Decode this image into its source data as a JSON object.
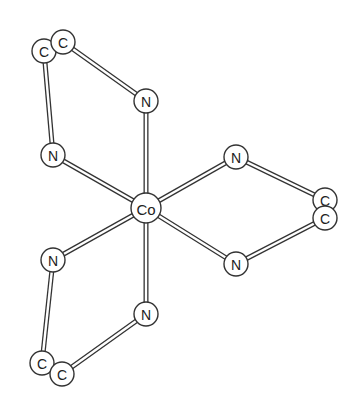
{
  "diagram": {
    "colors": {
      "stroke": "#333333",
      "bond_fill": "#ffffff",
      "atom_fill": "#ffffff",
      "background": "#ffffff"
    },
    "atoms": [
      {
        "id": "co",
        "label": "Co",
        "x": 146,
        "y": 208,
        "r": 15
      },
      {
        "id": "n1",
        "label": "N",
        "x": 146,
        "y": 101,
        "r": 12
      },
      {
        "id": "n2",
        "label": "N",
        "x": 53,
        "y": 155,
        "r": 12
      },
      {
        "id": "c1",
        "label": "C",
        "x": 44,
        "y": 51,
        "r": 12
      },
      {
        "id": "c2",
        "label": "C",
        "x": 63,
        "y": 42,
        "r": 12
      },
      {
        "id": "n3",
        "label": "N",
        "x": 236,
        "y": 157,
        "r": 12
      },
      {
        "id": "n4",
        "label": "N",
        "x": 236,
        "y": 264,
        "r": 12
      },
      {
        "id": "c3",
        "label": "C",
        "x": 325,
        "y": 200,
        "r": 12
      },
      {
        "id": "c4",
        "label": "C",
        "x": 325,
        "y": 218,
        "r": 12
      },
      {
        "id": "n5",
        "label": "N",
        "x": 53,
        "y": 260,
        "r": 12
      },
      {
        "id": "n6",
        "label": "N",
        "x": 146,
        "y": 314,
        "r": 12
      },
      {
        "id": "c5",
        "label": "C",
        "x": 42,
        "y": 363,
        "r": 12
      },
      {
        "id": "c6",
        "label": "C",
        "x": 62,
        "y": 374,
        "r": 12
      }
    ],
    "bonds": [
      [
        "co",
        "n1"
      ],
      [
        "co",
        "n2"
      ],
      [
        "co",
        "n3"
      ],
      [
        "co",
        "n4"
      ],
      [
        "co",
        "n5"
      ],
      [
        "co",
        "n6"
      ],
      [
        "n1",
        "c2"
      ],
      [
        "n2",
        "c1"
      ],
      [
        "n3",
        "c3"
      ],
      [
        "n4",
        "c4"
      ],
      [
        "n5",
        "c5"
      ],
      [
        "n6",
        "c6"
      ]
    ]
  }
}
